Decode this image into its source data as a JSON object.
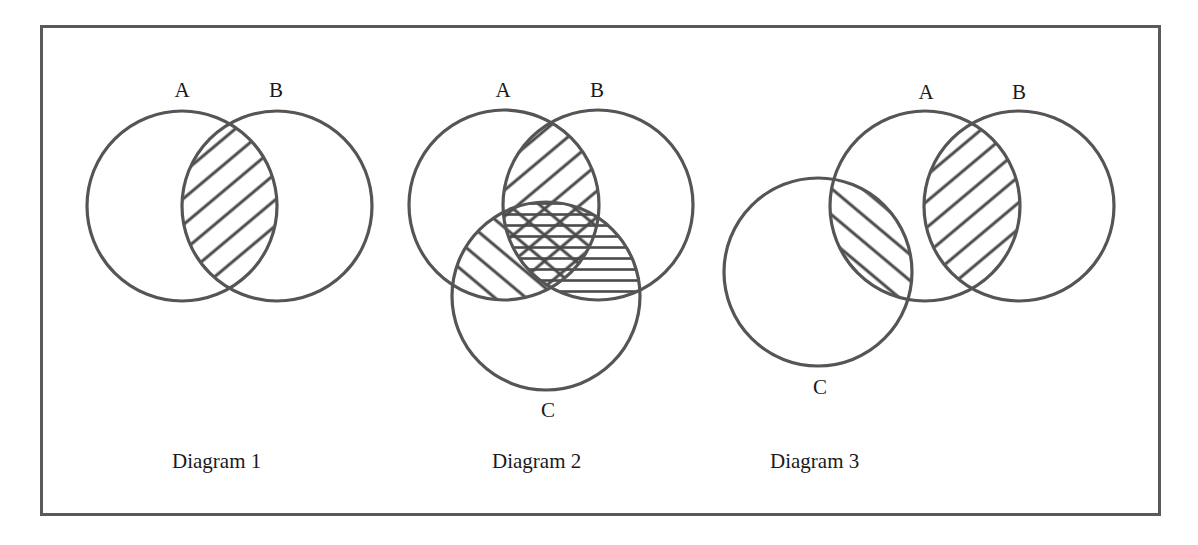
{
  "figure": {
    "border_color": "#5a5a5a",
    "stroke_color": "#555555",
    "hatch_color": "#4a4a4a"
  },
  "diagrams": [
    {
      "caption": "Diagram 1",
      "sets": [
        {
          "label": "A",
          "cx": 182,
          "cy": 206,
          "r": 95
        },
        {
          "label": "B",
          "cx": 277,
          "cy": 206,
          "r": 95
        }
      ],
      "shaded_regions": [
        {
          "region": "A∩B",
          "pattern": "diagonal-up"
        }
      ]
    },
    {
      "caption": "Diagram 2",
      "sets": [
        {
          "label": "A",
          "cx": 504,
          "cy": 205,
          "r": 95
        },
        {
          "label": "B",
          "cx": 598,
          "cy": 205,
          "r": 95
        },
        {
          "label": "C",
          "cx": 546,
          "cy": 296,
          "r": 94
        }
      ],
      "shaded_regions": [
        {
          "region": "A∩B",
          "pattern": "diagonal-up"
        },
        {
          "region": "A∩C",
          "pattern": "diagonal-down"
        },
        {
          "region": "B∩C",
          "pattern": "horizontal"
        },
        {
          "region": "A∩B∩C",
          "pattern": "crosshatch (all three)"
        }
      ]
    },
    {
      "caption": "Diagram 3",
      "sets": [
        {
          "label": "A",
          "cx": 925,
          "cy": 206,
          "r": 95
        },
        {
          "label": "B",
          "cx": 1019,
          "cy": 206,
          "r": 95
        },
        {
          "label": "C",
          "cx": 818,
          "cy": 272,
          "r": 94
        }
      ],
      "shaded_regions": [
        {
          "region": "A∩B",
          "pattern": "diagonal-up"
        },
        {
          "region": "A∩C",
          "pattern": "diagonal-down"
        }
      ]
    }
  ]
}
